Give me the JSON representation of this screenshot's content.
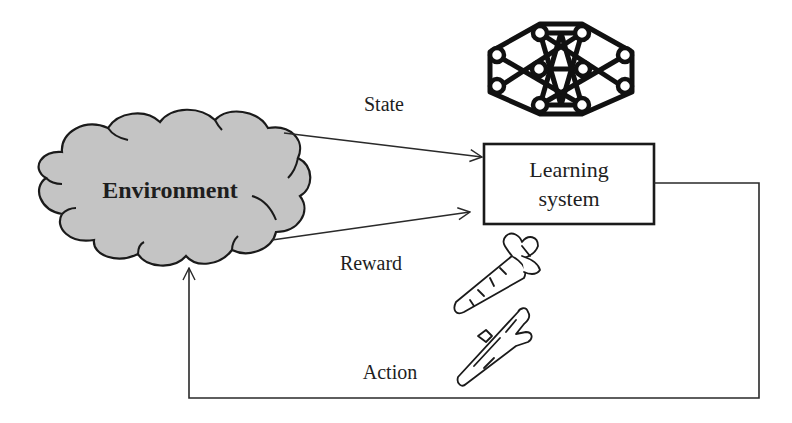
{
  "diagram": {
    "environment": {
      "label": "Environment",
      "fill": "#c4c4c4",
      "stroke": "#1a1a1a"
    },
    "learning_system": {
      "label_line1": "Learning",
      "label_line2": "system"
    },
    "edges": {
      "state": {
        "label": "State"
      },
      "reward": {
        "label": "Reward"
      },
      "action": {
        "label": "Action"
      }
    },
    "icons": {
      "agent": "neural-network-icon",
      "reward": "carrot-icon",
      "action": "stick-icon"
    }
  }
}
